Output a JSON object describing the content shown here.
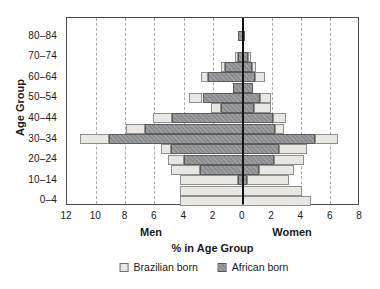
{
  "figure": {
    "ylabel": "Age Group",
    "xlabel": "% in Age Group",
    "left_label": "Men",
    "right_label": "Women",
    "legend": [
      {
        "label": "Brazilian born",
        "color": "#e9e7e1",
        "style": "light-solid"
      },
      {
        "label": "African born",
        "color": "#919295",
        "style": "gray-hatched"
      }
    ],
    "colors": {
      "frame": "#4a4a4a",
      "gridline": "#ababab",
      "zero_axis": "#111111",
      "text": "#1a1a1a"
    }
  },
  "chart_data": {
    "type": "bar",
    "subtype": "population-pyramid",
    "orientation": "horizontal",
    "grid": "vertical dashed every 2 units",
    "legend_position": "bottom-center",
    "categories": [
      "0–4",
      "5–9",
      "10–14",
      "15–19",
      "20–24",
      "25–29",
      "30–34",
      "35–39",
      "40–44",
      "45–49",
      "50–54",
      "55–59",
      "60–64",
      "65–69",
      "70–74",
      "75–79",
      "80–84"
    ],
    "visible_category_labels": [
      "0–4",
      "10–14",
      "20–24",
      "30–34",
      "40–44",
      "50–54",
      "60–64",
      "70–74",
      "80–84"
    ],
    "xlim_left": 12,
    "xlim_right": 8,
    "x_tick_values": [
      -12,
      -10,
      -8,
      -6,
      -4,
      -2,
      0,
      2,
      4,
      6,
      8
    ],
    "x_tick_labels": [
      "12",
      "10",
      "8",
      "6",
      "4",
      "2",
      "0",
      "2",
      "4",
      "6",
      "8"
    ],
    "grid_values": [
      -10,
      -8,
      -6,
      -4,
      -2,
      2,
      4,
      6
    ],
    "series": [
      {
        "name": "African born",
        "side": "men",
        "stack_order": "inner",
        "values": [
          0,
          0,
          0.35,
          2.9,
          4.0,
          4.9,
          9.1,
          6.7,
          4.8,
          1.5,
          2.75,
          0.7,
          2.35,
          1.2,
          0.35,
          0,
          0.35
        ]
      },
      {
        "name": "Brazilian born",
        "side": "men",
        "stack_order": "outer",
        "values": [
          4.3,
          4.3,
          3.95,
          2.0,
          1.1,
          0.7,
          2.0,
          1.3,
          1.3,
          0.7,
          0.9,
          0,
          0.5,
          0.3,
          0.2,
          0,
          0
        ]
      },
      {
        "name": "African born",
        "side": "women",
        "stack_order": "inner",
        "values": [
          0,
          0,
          0.3,
          1.1,
          2.1,
          2.5,
          4.9,
          2.2,
          2.05,
          0.75,
          1.2,
          0.7,
          0.8,
          0.6,
          0.35,
          0,
          0.15
        ]
      },
      {
        "name": "Brazilian born",
        "side": "women",
        "stack_order": "outer",
        "values": [
          4.65,
          4.05,
          2.85,
          2.4,
          2.05,
          1.9,
          1.6,
          0.6,
          0.9,
          1.2,
          0.75,
          0,
          0.7,
          0.3,
          0.2,
          0,
          0
        ]
      }
    ]
  }
}
